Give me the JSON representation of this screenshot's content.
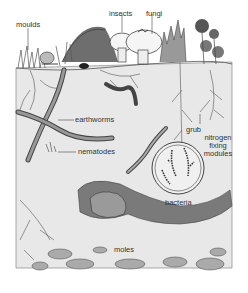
{
  "diagram": {
    "labels": {
      "moulds": "moulds",
      "insects": "insects",
      "fungi": "fungi",
      "earthworms": "earthworms",
      "nematodes": "nematodes",
      "grub": "grub",
      "nitrogen_line1": "nitrogen",
      "nitrogen_line2": "fixing",
      "nitrogen_line3": "modules",
      "bacteria": "bacteria",
      "moles": "moles"
    },
    "colors": {
      "sky": "#ffffff",
      "soil": "#e6e6e6",
      "soil_dark": "#8a8a8a",
      "ink": "#3a3a3a",
      "stone": "#a8a8a8",
      "mushroom": "#f2f2f2"
    }
  }
}
